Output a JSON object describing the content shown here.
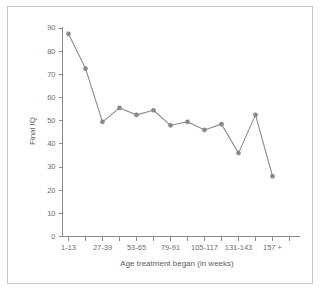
{
  "chart_data": {
    "type": "line",
    "title": "",
    "xlabel": "Age treatment began (in weeks)",
    "ylabel": "Final IQ",
    "ylim": [
      0,
      90
    ],
    "ytick_labels": [
      "0",
      "10",
      "20",
      "30",
      "40",
      "50",
      "60",
      "70",
      "80",
      "90"
    ],
    "ytick_values": [
      0,
      10,
      20,
      30,
      40,
      50,
      60,
      70,
      80,
      90
    ],
    "xtick_labels": [
      "1-13",
      "27-39",
      "53-65",
      "79-91",
      "105-117",
      "131-143",
      "157 +"
    ],
    "categories": [
      "1-13",
      "14-26",
      "27-39",
      "40-52",
      "53-65",
      "66-78",
      "79-91",
      "92-104",
      "105-117",
      "118-130",
      "131-143",
      "144-156",
      "157 +"
    ],
    "values": [
      87.5,
      72.5,
      49.5,
      55.5,
      52.5,
      54.5,
      48.0,
      49.5,
      46.0,
      48.5,
      36.0,
      52.5,
      26.0
    ],
    "grid": false,
    "legend": "none",
    "marker": "circle",
    "line_color": "#8d8d8d",
    "marker_color": "#8a8a8a",
    "axis_color": "#8a8a8a",
    "text_color": "#6e6e6e",
    "background": "#ffffff",
    "border_color": "#c9c9c9"
  }
}
